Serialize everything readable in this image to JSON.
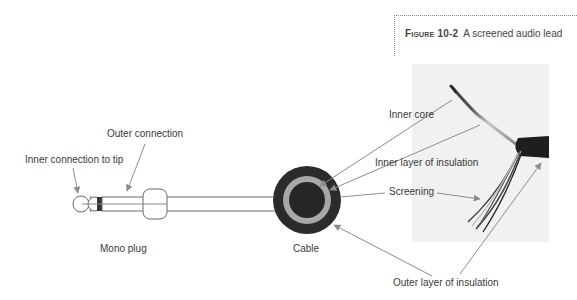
{
  "caption": {
    "figure_label": "Figure 10-2",
    "text": "A screened audio lead"
  },
  "labels": {
    "inner_connection": "Inner connection to tip",
    "outer_connection": "Outer connection",
    "mono_plug": "Mono plug",
    "cable": "Cable",
    "inner_core": "Inner core",
    "inner_insulation": "Inner layer of insulation",
    "screening": "Screening",
    "outer_insulation": "Outer layer of insulation"
  },
  "colors": {
    "cable_outer": "#2b2b2b",
    "cable_ring": "#a8a8a8",
    "cable_core": "#262626",
    "arrow": "#8c8c8c",
    "photo_bg": "#f1f1f1"
  }
}
